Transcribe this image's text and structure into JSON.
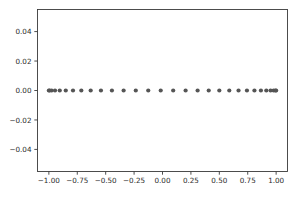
{
  "figure": {
    "background_color": "#ffffff",
    "width": 299,
    "height": 201
  },
  "chart_data": {
    "type": "scatter",
    "title": "",
    "xlabel": "",
    "ylabel": "",
    "xlim": [
      -1.1,
      1.1
    ],
    "ylim": [
      -0.055,
      0.055
    ],
    "grid": false,
    "legend": null,
    "marker": {
      "shape": "circle",
      "color": "#555555",
      "size_px": 4.2
    },
    "axis": {
      "x_ticks": [
        -1.0,
        -0.75,
        -0.5,
        -0.25,
        0.0,
        0.25,
        0.5,
        0.75,
        1.0
      ],
      "x_tick_labels": [
        "−1.00",
        "−0.75",
        "−0.50",
        "−0.25",
        "0.00",
        "0.25",
        "0.50",
        "0.75",
        "1.00"
      ],
      "y_ticks": [
        0.04,
        0.02,
        0.0,
        -0.02,
        -0.04
      ],
      "y_tick_labels": [
        "0.04",
        "0.02",
        "0.00",
        "−0.02",
        "−0.04"
      ],
      "tick_color": "#3a3a3a",
      "spine_color": "#3a3a3a"
    },
    "series": [
      {
        "name": "chebyshev-nodes",
        "x": [
          -1.0,
          -0.9939,
          -0.9759,
          -0.9458,
          -0.9041,
          -0.8512,
          -0.7876,
          -0.7143,
          -0.632,
          -0.5417,
          -0.4451,
          -0.342,
          -0.2351,
          -0.1253,
          -0.0157,
          0.0941,
          0.2034,
          0.309,
          0.4067,
          0.5,
          0.5878,
          0.6691,
          0.7431,
          0.809,
          0.866,
          0.9135,
          0.9511,
          0.9781,
          0.9945,
          1.0
        ],
        "y": [
          0,
          0,
          0,
          0,
          0,
          0,
          0,
          0,
          0,
          0,
          0,
          0,
          0,
          0,
          0,
          0,
          0,
          0,
          0,
          0,
          0,
          0,
          0,
          0,
          0,
          0,
          0,
          0,
          0,
          0
        ]
      }
    ]
  }
}
